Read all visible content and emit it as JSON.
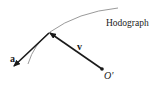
{
  "diagram": {
    "labels": {
      "acceleration": "a",
      "velocity": "v",
      "origin": "O'",
      "curve": "Hodograph"
    },
    "colors": {
      "curve": "#9a9a9a",
      "vector": "#1a1a1a",
      "text": "#1a1a1a",
      "background": "#ffffff"
    }
  }
}
